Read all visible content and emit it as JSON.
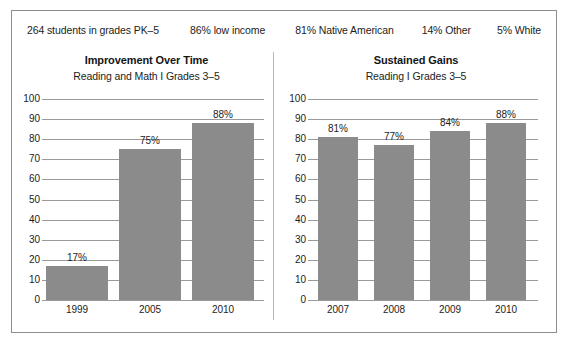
{
  "header": {
    "stats": [
      "264 students in grades PK–5",
      "86% low income",
      "81% Native American",
      "14% Other",
      "5% White"
    ]
  },
  "colors": {
    "bar": "#8b8b8b",
    "grid": "#9a9a9a",
    "frame": "#8d8d8d",
    "text": "#1c1c1c"
  },
  "chart_data": [
    {
      "type": "bar",
      "title": "Improvement Over Time",
      "subtitle": "Reading and Math  I  Grades 3–5",
      "categories": [
        "1999",
        "2005",
        "2010"
      ],
      "values": [
        17,
        75,
        88
      ],
      "data_labels": [
        "17%",
        "75%",
        "88%"
      ],
      "xlabel": "",
      "ylabel": "",
      "ylim": [
        0,
        100
      ],
      "yticks": [
        0,
        10,
        20,
        30,
        40,
        50,
        60,
        70,
        80,
        90,
        100
      ],
      "ytick_labels": [
        "0",
        "10",
        "20",
        "30",
        "40",
        "50",
        "60",
        "70",
        "80",
        "90",
        "100"
      ],
      "grid": true,
      "legend": false
    },
    {
      "type": "bar",
      "title": "Sustained Gains",
      "subtitle": "Reading  I  Grades 3–5",
      "categories": [
        "2007",
        "2008",
        "2009",
        "2010"
      ],
      "values": [
        81,
        77,
        84,
        88
      ],
      "data_labels": [
        "81%",
        "77%",
        "84%",
        "88%"
      ],
      "xlabel": "",
      "ylabel": "",
      "ylim": [
        0,
        100
      ],
      "yticks": [
        0,
        10,
        20,
        30,
        40,
        50,
        60,
        70,
        80,
        90,
        100
      ],
      "ytick_labels": [
        "0",
        "10",
        "20",
        "30",
        "40",
        "50",
        "60",
        "70",
        "80",
        "90",
        "100"
      ],
      "grid": true,
      "legend": false
    }
  ]
}
